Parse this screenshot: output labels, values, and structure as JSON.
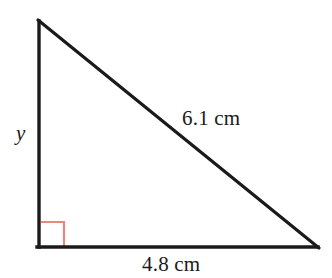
{
  "figure": {
    "shape": "right triangle",
    "stroke_color": "#1a1a1a",
    "background_color": "#ffffff",
    "right_angle_marker_color": "#e8897c",
    "vertices": {
      "apex": [
        38,
        20
      ],
      "bottom_left": [
        38,
        247
      ],
      "bottom_right": [
        318,
        247
      ]
    },
    "labels": {
      "hypotenuse": "6.1 cm",
      "base": "4.8 cm",
      "vertical_side": "y"
    },
    "right_angle_marker": {
      "x": 41,
      "y": 222,
      "size": 23
    }
  },
  "top_clipped_text_marks": [
    {
      "left": 33,
      "width": 12
    },
    {
      "left": 97,
      "width": 12
    },
    {
      "left": 179,
      "width": 12
    }
  ]
}
